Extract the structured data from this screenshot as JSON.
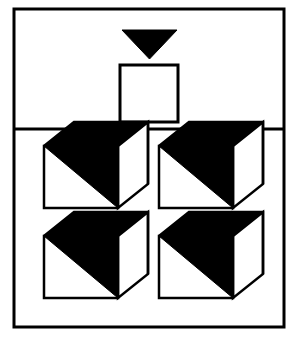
{
  "figure": {
    "title": "Visual reasoning figure: triangle and square above four cubes",
    "background_color": "#ffffff",
    "ink_color": "#000000",
    "canvas": {
      "width": 296,
      "height": 343
    }
  },
  "frame": {
    "label": "outer-frame",
    "x": 14,
    "y": 9,
    "width": 270,
    "height": 318,
    "stroke_color": "#000000",
    "stroke_width": 3,
    "fill": "none"
  },
  "divider": {
    "label": "panel-divider",
    "x1": 14,
    "y1": 129,
    "x2": 284,
    "y2": 129,
    "stroke_color": "#000000",
    "stroke_width": 3
  },
  "top_panel": {
    "label": "top-panel",
    "name": "prompt-panel",
    "triangle": {
      "label": "black-down-triangle",
      "points": "122,30 177,30 149.5,59",
      "fill_color": "#000000",
      "stroke_color": "#000000",
      "orientation": "pointing-down",
      "width": 55,
      "height": 29
    },
    "square": {
      "label": "empty-square-outline",
      "x": 120,
      "y": 65,
      "width": 58,
      "height": 57,
      "fill_color": "#ffffff",
      "stroke_color": "#000000",
      "stroke_width": 3
    }
  },
  "bottom_panel": {
    "label": "answer-panel",
    "name": "options-panel",
    "rows": 2,
    "columns": 2,
    "cube": {
      "label": "cube-figure",
      "front_face_fill": "#ffffff",
      "shaded_face_fill": "#000000",
      "side_face_fill": "#ffffff",
      "stroke_color": "#000000",
      "stroke_width": 2.5,
      "front_width": 74,
      "front_height": 62,
      "depth_x": 30,
      "depth_y": -24
    },
    "cells": [
      {
        "label": "cube-top-left",
        "name": "option-1",
        "origin_x": 44,
        "origin_y": 146,
        "row": 1,
        "column": 1
      },
      {
        "label": "cube-top-right",
        "name": "option-2",
        "origin_x": 159,
        "origin_y": 146,
        "row": 1,
        "column": 2
      },
      {
        "label": "cube-bottom-left",
        "name": "option-3",
        "origin_x": 44,
        "origin_y": 236,
        "row": 2,
        "column": 1
      },
      {
        "label": "cube-bottom-right",
        "name": "option-4",
        "origin_x": 159,
        "origin_y": 236,
        "row": 2,
        "column": 2
      }
    ]
  }
}
